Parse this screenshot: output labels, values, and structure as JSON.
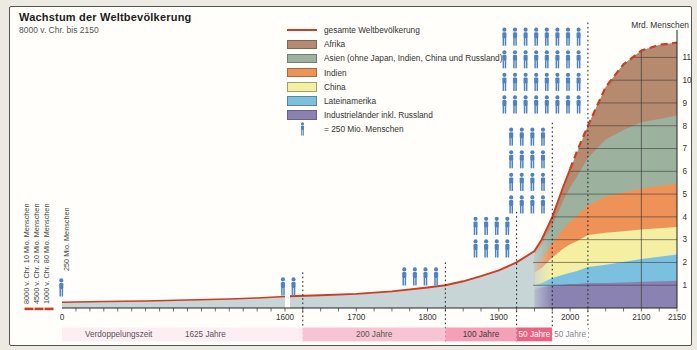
{
  "ui": {
    "title": "Wachstum der Weltbevölkerung",
    "subtitle": "8000 v. Chr. bis 2150",
    "right_axis_label": "Mrd. Menschen",
    "doubling_label": "Verdoppelungszeit",
    "person_scale_label": "250 Mio. Menschen",
    "left_labels": [
      "8000 v. Chr. 10 Mio. Menschen",
      "4500 v. Chr. 20 Mio. Menschen",
      "1000 v. Chr. 80 Mio. Menschen"
    ],
    "legend": {
      "items": [
        {
          "kind": "line",
          "color": "#cc3d22",
          "label": "gesamte Weltbevölkerung"
        },
        {
          "kind": "fill",
          "color": "#b58a6f",
          "label": "Afrika"
        },
        {
          "kind": "fill",
          "color": "#9cb29e",
          "label": "Asien (ohne Japan, Indien, China und Russland)"
        },
        {
          "kind": "fill",
          "color": "#ef9257",
          "label": "Indien"
        },
        {
          "kind": "fill",
          "color": "#f5efa4",
          "label": "China"
        },
        {
          "kind": "fill",
          "color": "#7cc0e0",
          "label": "Lateinamerika"
        },
        {
          "kind": "fill",
          "color": "#8a83b2",
          "label": "Industrieländer inkl. Russland"
        },
        {
          "kind": "person",
          "color": "#4d82c4",
          "label": "= 250 Mio. Menschen"
        }
      ]
    },
    "bands": [
      {
        "label": "1625 Jahre",
        "from": 0,
        "to": 1625,
        "color": "#fdeef3",
        "text_color": "#555555"
      },
      {
        "label": "200 Jahre",
        "from": 1625,
        "to": 1825,
        "color": "#f8c3d2",
        "text_color": "#555555"
      },
      {
        "label": "100 Jahre",
        "from": 1825,
        "to": 1925,
        "color": "#f5a0b6",
        "text_color": "#44383c"
      },
      {
        "label": "50 Jahre",
        "from": 1925,
        "to": 1975,
        "color": "#ee6183",
        "text_color": "#ffffff"
      },
      {
        "label": "50 Jahre",
        "from": 1975,
        "to": 2025,
        "color": "#ffffff",
        "text_color": "#888888"
      }
    ]
  },
  "chart_data": {
    "type": "area",
    "title": "Wachstum der Weltbevölkerung",
    "subtitle": "8000 v. Chr. bis 2150",
    "x_axis": {
      "ticks": [
        {
          "year": 0,
          "label": "0"
        },
        {
          "year": 1600,
          "label": "1600"
        },
        {
          "year": 1700,
          "label": "1700"
        },
        {
          "year": 1800,
          "label": "1800"
        },
        {
          "year": 1900,
          "label": "1900"
        },
        {
          "year": 2000,
          "label": "2000"
        },
        {
          "year": 2100,
          "label": "2100"
        },
        {
          "year": 2150,
          "label": "2150"
        }
      ]
    },
    "y_axis": {
      "label": "Mrd. Menschen",
      "ticks": [
        1,
        2,
        3,
        4,
        5,
        6,
        7,
        8,
        9,
        10,
        11
      ],
      "range": [
        0,
        12
      ]
    },
    "world_total": {
      "label": "gesamte Weltbevölkerung",
      "color": "#cc3d22",
      "points_early": [
        [
          0,
          0.25
        ],
        [
          300,
          0.28
        ],
        [
          600,
          0.31
        ],
        [
          900,
          0.35
        ],
        [
          1200,
          0.4
        ],
        [
          1400,
          0.44
        ],
        [
          1600,
          0.5
        ]
      ],
      "points": [
        [
          1607,
          0.52
        ],
        [
          1650,
          0.56
        ],
        [
          1700,
          0.62
        ],
        [
          1750,
          0.73
        ],
        [
          1800,
          0.9
        ],
        [
          1825,
          1.0
        ],
        [
          1850,
          1.17
        ],
        [
          1875,
          1.4
        ],
        [
          1900,
          1.65
        ],
        [
          1925,
          2.0
        ],
        [
          1950,
          2.5
        ],
        [
          1960,
          3.0
        ],
        [
          1975,
          4.0
        ],
        [
          1990,
          5.3
        ],
        [
          2000,
          6.1
        ],
        [
          2010,
          6.9
        ],
        [
          2025,
          8.0
        ],
        [
          2050,
          9.7
        ],
        [
          2075,
          10.7
        ],
        [
          2100,
          11.3
        ],
        [
          2125,
          11.55
        ],
        [
          2150,
          11.65
        ]
      ],
      "dashed_from": 2000
    },
    "stack_area_color_pre1950": "#c7d5d7",
    "x": [
      1950,
      1960,
      1975,
      1990,
      2000,
      2010,
      2025,
      2050,
      2075,
      2100,
      2125,
      2150
    ],
    "series": [
      {
        "id": "industrielaender",
        "name": "Industrieländer inkl. Russland",
        "color": "#8a83b2",
        "values": [
          0.83,
          0.9,
          1.0,
          1.02,
          1.05,
          1.05,
          1.1,
          1.1,
          1.12,
          1.15,
          1.17,
          1.2
        ]
      },
      {
        "id": "lateinamerika",
        "name": "Lateinamerika",
        "color": "#7cc0e0",
        "values": [
          0.17,
          0.2,
          0.32,
          0.44,
          0.5,
          0.57,
          0.7,
          0.8,
          0.9,
          1.0,
          1.08,
          1.15
        ]
      },
      {
        "id": "china",
        "name": "China",
        "color": "#f5efa4",
        "values": [
          0.55,
          0.66,
          0.9,
          1.14,
          1.25,
          1.32,
          1.4,
          1.4,
          1.35,
          1.3,
          1.25,
          1.2
        ]
      },
      {
        "id": "indien",
        "name": "Indien",
        "color": "#ef9257",
        "values": [
          0.37,
          0.45,
          0.62,
          0.85,
          1.0,
          1.12,
          1.3,
          1.6,
          1.7,
          1.8,
          1.85,
          1.9
        ]
      },
      {
        "id": "asien",
        "name": "Asien (ohne Japan, Indien, China und Russland)",
        "color": "#9cb29e",
        "values": [
          0.38,
          0.52,
          0.78,
          1.25,
          1.5,
          1.72,
          2.1,
          2.5,
          2.75,
          2.9,
          2.95,
          3.0
        ]
      },
      {
        "id": "afrika",
        "name": "Afrika",
        "color": "#b58a6f",
        "values": [
          0.2,
          0.27,
          0.4,
          0.6,
          0.8,
          1.02,
          1.4,
          2.3,
          2.88,
          3.15,
          3.25,
          3.2
        ]
      }
    ],
    "milestones": [
      {
        "year": 0,
        "icons": 1
      },
      {
        "year": 1625,
        "icons": 2
      },
      {
        "year": 1825,
        "icons": 4
      },
      {
        "year": 1925,
        "icons": 8
      },
      {
        "year": 1975,
        "icons": 16
      },
      {
        "year": 2025,
        "icons": 32
      }
    ],
    "person_unit_mio": 250
  }
}
